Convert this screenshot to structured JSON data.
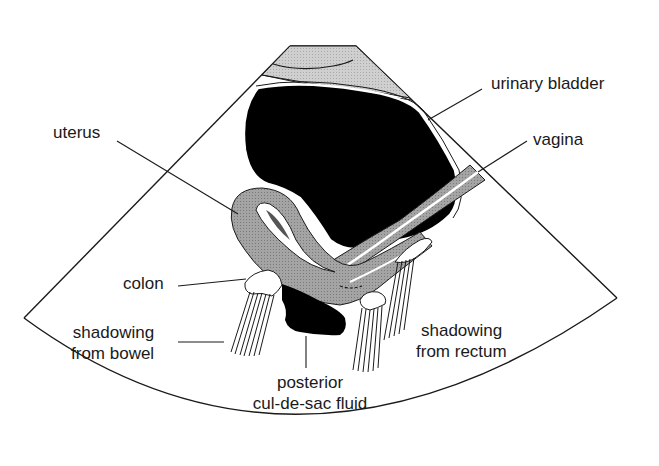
{
  "figure": {
    "type": "transabdominal pelvic ultrasound schematic (sagittal)",
    "colors": {
      "fluid": "#000000",
      "tissue": "#9a9a9a",
      "wall_light": "#c8c8c8",
      "outline": "#1a1a1a",
      "background": "#ffffff"
    }
  },
  "labels": {
    "urinary_bladder": "urinary bladder",
    "vagina": "vagina",
    "uterus": "uterus",
    "colon": "colon",
    "shadowing_bowel_1": "shadowing",
    "shadowing_bowel_2": "from bowel",
    "posterior_1": "posterior",
    "posterior_2": "cul-de-sac fluid",
    "shadowing_rectum_1": "shadowing",
    "shadowing_rectum_2": "from rectum"
  }
}
